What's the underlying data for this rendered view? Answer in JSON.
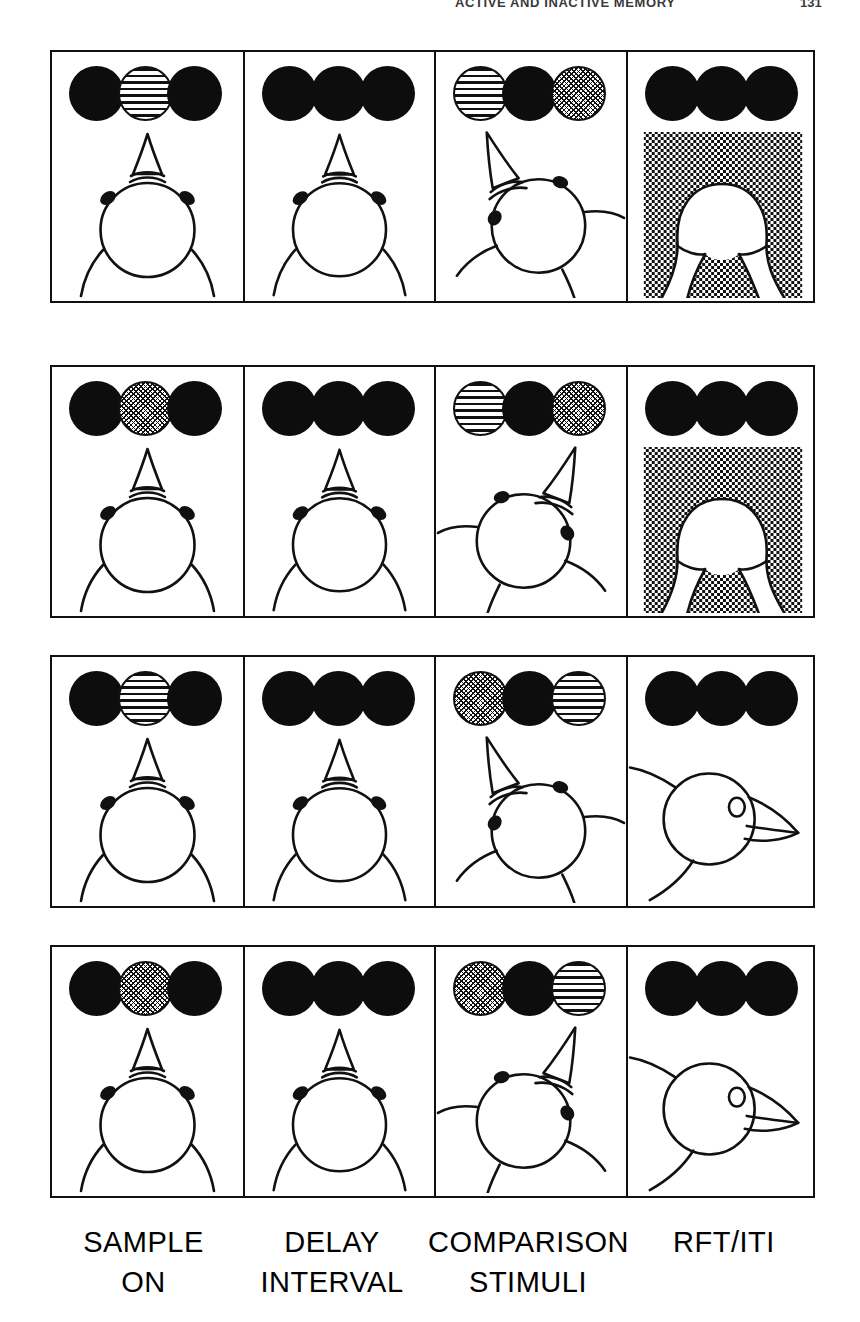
{
  "running_head": {
    "title": "ACTIVE AND INACTIVE MEMORY",
    "page_number": "131"
  },
  "figure": {
    "type": "delayed-matching-to-sample-trial-diagram",
    "columns": [
      {
        "id": "sample",
        "label_line1": "SAMPLE",
        "label_line2": "ON"
      },
      {
        "id": "delay",
        "label_line1": "DELAY",
        "label_line2": "INTERVAL"
      },
      {
        "id": "comparison",
        "label_line1": "COMPARISON",
        "label_line2": "STIMULI"
      },
      {
        "id": "outcome",
        "label_line1": "RFT/ITI",
        "label_line2": ""
      }
    ],
    "key_types": {
      "dark": "dark / unlit key",
      "striped": "horizontal lines key",
      "dotted": "dots / stipple key"
    },
    "rows": [
      {
        "trial": 1,
        "sample_stimulus": "striped",
        "choice": "striped",
        "correct": true,
        "panels": [
          {
            "stage": "sample",
            "keys": [
              "dark",
              "striped",
              "dark"
            ],
            "bird": "facing-forward",
            "hopper": false
          },
          {
            "stage": "delay",
            "keys": [
              "dark",
              "dark",
              "dark"
            ],
            "bird": "facing-forward",
            "hopper": false
          },
          {
            "stage": "comparison",
            "keys": [
              "striped",
              "dark",
              "dotted"
            ],
            "bird": "turned-left",
            "hopper": false
          },
          {
            "stage": "outcome",
            "keys": [
              "dark",
              "dark",
              "dark"
            ],
            "bird": "in-hopper",
            "hopper": true
          }
        ]
      },
      {
        "trial": 2,
        "sample_stimulus": "dotted",
        "choice": "dotted",
        "correct": true,
        "panels": [
          {
            "stage": "sample",
            "keys": [
              "dark",
              "dotted",
              "dark"
            ],
            "bird": "facing-forward",
            "hopper": false
          },
          {
            "stage": "delay",
            "keys": [
              "dark",
              "dark",
              "dark"
            ],
            "bird": "facing-forward",
            "hopper": false
          },
          {
            "stage": "comparison",
            "keys": [
              "striped",
              "dark",
              "dotted"
            ],
            "bird": "turned-right",
            "hopper": false
          },
          {
            "stage": "outcome",
            "keys": [
              "dark",
              "dark",
              "dark"
            ],
            "bird": "in-hopper",
            "hopper": true
          }
        ]
      },
      {
        "trial": 3,
        "sample_stimulus": "striped",
        "choice": "dotted",
        "correct": false,
        "panels": [
          {
            "stage": "sample",
            "keys": [
              "dark",
              "striped",
              "dark"
            ],
            "bird": "facing-forward",
            "hopper": false
          },
          {
            "stage": "delay",
            "keys": [
              "dark",
              "dark",
              "dark"
            ],
            "bird": "facing-forward",
            "hopper": false
          },
          {
            "stage": "comparison",
            "keys": [
              "dotted",
              "dark",
              "striped"
            ],
            "bird": "turned-left",
            "hopper": false
          },
          {
            "stage": "outcome",
            "keys": [
              "dark",
              "dark",
              "dark"
            ],
            "bird": "profile-right",
            "hopper": false
          }
        ]
      },
      {
        "trial": 4,
        "sample_stimulus": "dotted",
        "choice": "striped",
        "correct": false,
        "panels": [
          {
            "stage": "sample",
            "keys": [
              "dark",
              "dotted",
              "dark"
            ],
            "bird": "facing-forward",
            "hopper": false
          },
          {
            "stage": "delay",
            "keys": [
              "dark",
              "dark",
              "dark"
            ],
            "bird": "facing-forward",
            "hopper": false
          },
          {
            "stage": "comparison",
            "keys": [
              "dotted",
              "dark",
              "striped"
            ],
            "bird": "turned-right",
            "hopper": false
          },
          {
            "stage": "outcome",
            "keys": [
              "dark",
              "dark",
              "dark"
            ],
            "bird": "profile-right",
            "hopper": false
          }
        ]
      }
    ]
  },
  "colors": {
    "ink": "#111111",
    "key_dark": "#0d0d0d",
    "paper": "#ffffff"
  }
}
